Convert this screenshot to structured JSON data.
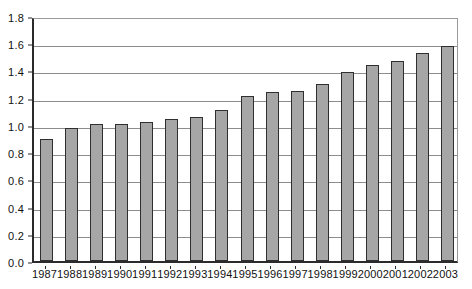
{
  "chart_data": {
    "type": "bar",
    "title": "",
    "subtitle": "",
    "xlabel": "",
    "ylabel": "",
    "categories": [
      "1987",
      "1988",
      "1989",
      "1990",
      "1991",
      "1992",
      "1993",
      "1994",
      "1995",
      "1996",
      "1997",
      "1998",
      "1999",
      "2000",
      "2001",
      "2002",
      "2003"
    ],
    "values": [
      0.9,
      0.98,
      1.01,
      1.01,
      1.02,
      1.04,
      1.06,
      1.11,
      1.21,
      1.24,
      1.25,
      1.3,
      1.39,
      1.44,
      1.47,
      1.53,
      1.58
    ],
    "series": [
      {
        "name": "",
        "values": [
          0.9,
          0.98,
          1.01,
          1.01,
          1.02,
          1.04,
          1.06,
          1.11,
          1.21,
          1.24,
          1.25,
          1.3,
          1.39,
          1.44,
          1.47,
          1.53,
          1.58
        ]
      }
    ],
    "ylim": [
      0.0,
      1.8
    ],
    "ytick_labels": [
      "0.0",
      "0.2",
      "0.4",
      "0.6",
      "0.8",
      "1.0",
      "1.2",
      "1.4",
      "1.6",
      "1.8"
    ],
    "ytick_values": [
      0.0,
      0.2,
      0.4,
      0.6,
      0.8,
      1.0,
      1.2,
      1.4,
      1.6,
      1.8
    ],
    "grid": true,
    "grid_axis": "y",
    "legend": false,
    "legend_position": "none",
    "annotations": [],
    "colors": {
      "bar_fill": "#a6a6a6",
      "bar_border": "#2f2f2f",
      "gridline": "#8d8d8d",
      "axis": "#2b2b2b",
      "plot_background": "#ffffff",
      "text": "#111111"
    }
  }
}
